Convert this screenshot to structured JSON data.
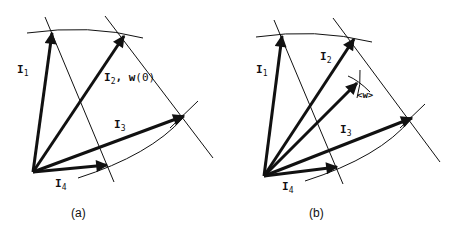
{
  "panels": [
    {
      "caption": "(a)",
      "labels": {
        "I1": {
          "base": "I",
          "sub": "1"
        },
        "I2": {
          "base": "I",
          "sub": "2",
          "suffix_bold": ", w",
          "suffix": "(0)"
        },
        "I3": {
          "base": "I",
          "sub": "3"
        },
        "I4": {
          "base": "I",
          "sub": "4"
        }
      }
    },
    {
      "caption": "(b)",
      "labels": {
        "I1": {
          "base": "I",
          "sub": "1"
        },
        "I2": {
          "base": "I",
          "sub": "2"
        },
        "I3": {
          "base": "I",
          "sub": "3"
        },
        "I4": {
          "base": "I",
          "sub": "4"
        },
        "W": "<w>"
      }
    }
  ]
}
